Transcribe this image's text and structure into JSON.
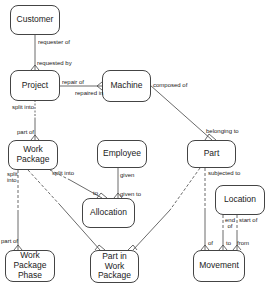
{
  "diagram": {
    "type": "entity-relationship",
    "entities": [
      {
        "id": "customer",
        "label": "Customer"
      },
      {
        "id": "project",
        "label": "Project"
      },
      {
        "id": "machine",
        "label": "Machine"
      },
      {
        "id": "work_package",
        "label": "Work Package"
      },
      {
        "id": "employee",
        "label": "Employee"
      },
      {
        "id": "part",
        "label": "Part"
      },
      {
        "id": "location",
        "label": "Location"
      },
      {
        "id": "allocation",
        "label": "Allocation"
      },
      {
        "id": "work_package_phase",
        "label": "Work Package Phase"
      },
      {
        "id": "part_in_work_package",
        "label": "Part in Work Package"
      },
      {
        "id": "movement",
        "label": "Movement"
      }
    ],
    "relationships": [
      {
        "from": "customer",
        "to": "project",
        "from_label": "requester of",
        "to_label": "requested by"
      },
      {
        "from": "project",
        "to": "machine",
        "from_label": "repair of",
        "to_label": "repaired in"
      },
      {
        "from": "project",
        "to": "work_package",
        "from_label": "split into",
        "to_label": "part of"
      },
      {
        "from": "machine",
        "to": "part",
        "from_label": "composed of",
        "to_label": "belonging to"
      },
      {
        "from": "work_package",
        "to": "allocation",
        "from_label": "split into",
        "to_label": "to"
      },
      {
        "from": "employee",
        "to": "allocation",
        "from_label": "given",
        "to_label": "given to"
      },
      {
        "from": "work_package",
        "to": "work_package_phase",
        "from_label": "split into",
        "to_label": "part of"
      },
      {
        "from": "work_package",
        "to": "part_in_work_package",
        "from_label": "",
        "to_label": ""
      },
      {
        "from": "part",
        "to": "part_in_work_package",
        "from_label": "",
        "to_label": ""
      },
      {
        "from": "part",
        "to": "movement",
        "from_label": "subjected to",
        "to_label": "of"
      },
      {
        "from": "location",
        "to": "movement",
        "from_label": "end of",
        "to_label": "to"
      },
      {
        "from": "location",
        "to": "movement",
        "from_label": "start of",
        "to_label": "from"
      }
    ]
  },
  "labels": {
    "customer": "Customer",
    "project": "Project",
    "machine": "Machine",
    "work_package": "Work\nPackage",
    "employee": "Employee",
    "part": "Part",
    "location": "Location",
    "allocation": "Allocation",
    "work_package_phase": "Work\nPackage\nPhase",
    "part_in_work_package": "Part in\nWork\nPackage",
    "movement": "Movement",
    "requester_of": "requester of",
    "requested_by": "requested by",
    "repair_of": "repair of",
    "repaired_in": "repaired in",
    "split_into_project": "split into",
    "part_of_wp": "part of",
    "composed_of": "composed of",
    "belonging_to": "belonging to",
    "split_into_alloc": "split into",
    "to_alloc": "to",
    "given": "given",
    "given_to": "given to",
    "split_into_phase": "split\ninto",
    "part_of_phase": "part of",
    "subjected_to": "subjected to",
    "of_movement": "of",
    "end_of": "end\nof",
    "start_of": "start of",
    "to_movement": "to",
    "from_movement": "from"
  }
}
